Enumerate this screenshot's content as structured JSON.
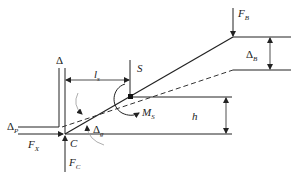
{
  "diagram": {
    "labels": {
      "F_B": {
        "main": "F",
        "sub": "B"
      },
      "Delta_B": {
        "main": "Δ",
        "sub": "B"
      },
      "Delta": {
        "main": "Δ"
      },
      "l_s": {
        "main": "l",
        "sub": "s"
      },
      "S": {
        "main": "S"
      },
      "M_S": {
        "main": "M",
        "sub": "S"
      },
      "h": {
        "main": "h"
      },
      "Delta_P": {
        "main": "Δ",
        "sub": "P"
      },
      "F_X": {
        "main": "F",
        "sub": "X"
      },
      "C": {
        "main": "C"
      },
      "Delta_g": {
        "main": "Δ",
        "sub": "g"
      },
      "F_C": {
        "main": "F",
        "sub": "C"
      }
    },
    "colors": {
      "line": "#222222",
      "dashed": "#333333",
      "grey_arc": "#999999"
    }
  }
}
